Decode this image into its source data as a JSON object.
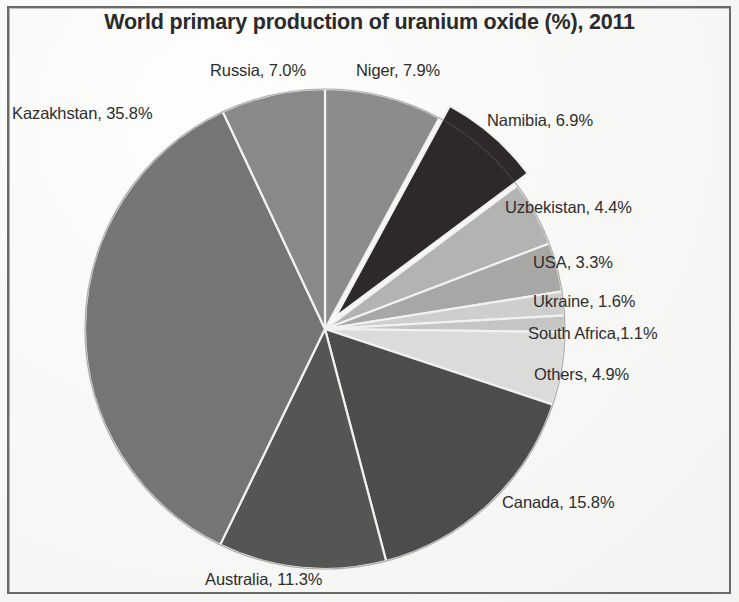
{
  "chart_data": {
    "type": "pie",
    "title": "World primary production of uranium oxide (%), 2011",
    "unit": "%",
    "legend": "labels-outside",
    "start_angle_deg": -90,
    "direction": "clockwise",
    "center": {
      "x": 325,
      "y": 329
    },
    "radius": 240,
    "categories": [
      "Niger",
      "Namibia",
      "Uzbekistan",
      "USA",
      "Ukraine",
      "South Africa",
      "Others",
      "Canada",
      "Australia",
      "Kazakhstan",
      "Russia"
    ],
    "values": [
      7.9,
      6.9,
      4.4,
      3.3,
      1.6,
      1.1,
      4.9,
      15.8,
      11.3,
      35.8,
      7.0
    ],
    "slices": [
      {
        "name": "Niger",
        "value": 7.9,
        "label": "Niger, 7.9%",
        "color": "#8d8d8d",
        "exploded": false
      },
      {
        "name": "Namibia",
        "value": 6.9,
        "label": "Namibia, 6.9%",
        "color": "#2e2b29",
        "exploded": true
      },
      {
        "name": "Uzbekistan",
        "value": 4.4,
        "label": "Uzbekistan, 4.4%",
        "color": "#b4b4b2",
        "exploded": false
      },
      {
        "name": "USA",
        "value": 3.3,
        "label": "USA, 3.3%",
        "color": "#a8a8a6",
        "exploded": false
      },
      {
        "name": "Ukraine",
        "value": 1.6,
        "label": "Ukraine, 1.6%",
        "color": "#cfcfcd",
        "exploded": false
      },
      {
        "name": "South Africa",
        "value": 1.1,
        "label": "South Africa,1.1%",
        "color": "#c6c6c4",
        "exploded": false
      },
      {
        "name": "Others",
        "value": 4.9,
        "label": "Others, 4.9%",
        "color": "#dcdcda",
        "exploded": false
      },
      {
        "name": "Canada",
        "value": 15.8,
        "label": "Canada, 15.8%",
        "color": "#4e4e4e",
        "exploded": false
      },
      {
        "name": "Australia",
        "value": 11.3,
        "label": "Australia, 11.3%",
        "color": "#565654",
        "exploded": false
      },
      {
        "name": "Kazakhstan",
        "value": 35.8,
        "label": "Kazakhstan, 35.8%",
        "color": "#767674",
        "exploded": false
      },
      {
        "name": "Russia",
        "value": 7.0,
        "label": "Russia, 7.0%",
        "color": "#8a8a88",
        "exploded": false
      }
    ],
    "slice_border_color": "#f2f2f0",
    "total": 100.0
  },
  "labels": {
    "kazakhstan": "Kazakhstan, 35.8%",
    "russia": "Russia, 7.0%",
    "niger": "Niger, 7.9%",
    "namibia": "Namibia, 6.9%",
    "uzbekistan": "Uzbekistan, 4.4%",
    "usa": "USA, 3.3%",
    "ukraine": "Ukraine, 1.6%",
    "south_africa": "South Africa,1.1%",
    "others": "Others, 4.9%",
    "canada": "Canada, 15.8%",
    "australia": "Australia, 11.3%"
  },
  "colors": {
    "background": "#fbfbfa",
    "frame": "#6a6a68",
    "text": "#2e2e2e",
    "title": "#2b2b2b",
    "slice_divider": "#f2f2f0"
  }
}
